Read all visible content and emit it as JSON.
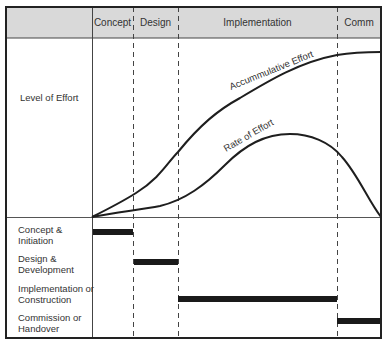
{
  "header": {
    "phases": [
      {
        "label": "Concept",
        "x_start": 92,
        "x_end": 133
      },
      {
        "label": "Design",
        "x_start": 133,
        "x_end": 178
      },
      {
        "label": "Implementation",
        "x_start": 178,
        "x_end": 337
      },
      {
        "label": "Comm",
        "x_start": 337,
        "x_end": 381
      }
    ]
  },
  "upper_panel": {
    "row_label": "Level of Effort",
    "curves": [
      {
        "name": "accumulative-effort",
        "label": "Accummulative Effort"
      },
      {
        "name": "rate-of-effort",
        "label": "Rate of Effort"
      }
    ]
  },
  "lower_panel": {
    "rows": [
      {
        "label_line1": "Concept &",
        "label_line2": "Initiation",
        "bar_start": 93,
        "bar_end": 133
      },
      {
        "label_line1": "Design &",
        "label_line2": "Development",
        "bar_start": 134,
        "bar_end": 178
      },
      {
        "label_line1": "Implementation or",
        "label_line2": "Construction",
        "bar_start": 178,
        "bar_end": 337
      },
      {
        "label_line1": "Commission or",
        "label_line2": " Handover",
        "bar_start": 337,
        "bar_end": 380
      }
    ]
  },
  "colors": {
    "header_fill": "#d9d9d9",
    "frame": "#222222",
    "bar": "#1a1a1a",
    "curve": "#1e1e1e",
    "grid": "#555555"
  }
}
